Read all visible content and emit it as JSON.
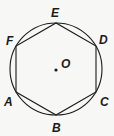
{
  "diagram": {
    "type": "geometry",
    "stroke_color": "#1a1a1a",
    "background": "#f7f7f5",
    "circle": {
      "cx": 56,
      "cy": 69,
      "r": 46
    },
    "center": {
      "label": "O",
      "x": 56,
      "y": 70
    },
    "vertices": [
      {
        "label": "A",
        "x": 16,
        "y": 92,
        "lx": 4,
        "ly": 106
      },
      {
        "label": "B",
        "x": 56,
        "y": 115,
        "lx": 52,
        "ly": 132
      },
      {
        "label": "C",
        "x": 96,
        "y": 92,
        "lx": 100,
        "ly": 106
      },
      {
        "label": "D",
        "x": 96,
        "y": 46,
        "lx": 99,
        "ly": 44
      },
      {
        "label": "E",
        "x": 56,
        "y": 23,
        "lx": 51,
        "ly": 17
      },
      {
        "label": "F",
        "x": 16,
        "y": 46,
        "lx": 6,
        "ly": 45
      }
    ]
  }
}
